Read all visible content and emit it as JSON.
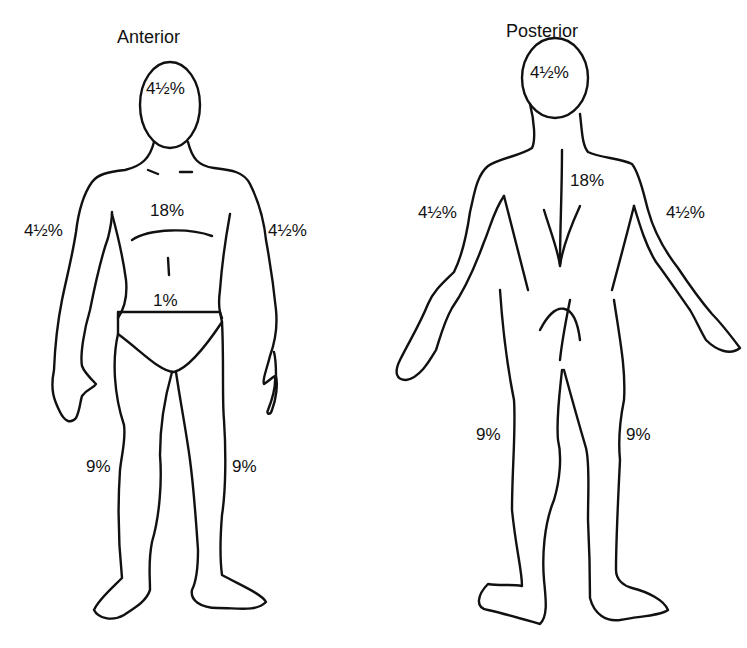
{
  "figure": {
    "anterior": {
      "title": "Anterior",
      "regions": {
        "head": "4½%",
        "trunk": "18%",
        "right_arm": "4½%",
        "left_arm": "4½%",
        "genitalia": "1%",
        "right_leg": "9%",
        "left_leg": "9%"
      }
    },
    "posterior": {
      "title": "Posterior",
      "regions": {
        "head": "4½%",
        "trunk": "18%",
        "left_arm": "4½%",
        "right_arm": "4½%",
        "left_leg": "9%",
        "right_leg": "9%"
      }
    },
    "colors": {
      "stroke": "#111111",
      "background": "#ffffff"
    }
  }
}
